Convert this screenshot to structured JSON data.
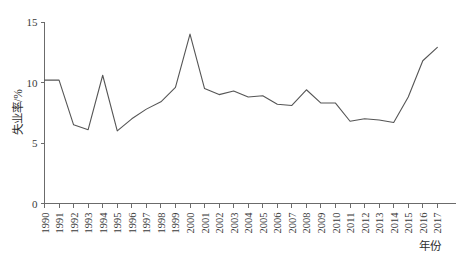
{
  "chart_data": {
    "type": "line",
    "title": "",
    "xlabel": "年份",
    "ylabel": "失业率/%",
    "xlim": [
      1990,
      2017
    ],
    "ylim": [
      0,
      15
    ],
    "yticks": [
      0,
      5,
      10,
      15
    ],
    "ytick_labels": [
      "0",
      "5",
      "10",
      "15"
    ],
    "grid": false,
    "legend": null,
    "line_color": "#555555",
    "x": [
      1990,
      1991,
      1992,
      1993,
      1994,
      1995,
      1996,
      1997,
      1998,
      1999,
      2000,
      2001,
      2002,
      2003,
      2004,
      2005,
      2006,
      2007,
      2008,
      2009,
      2010,
      2011,
      2012,
      2013,
      2014,
      2015,
      2016,
      2017
    ],
    "categories": [
      "1990",
      "1991",
      "1992",
      "1993",
      "1994",
      "1995",
      "1996",
      "1997",
      "1998",
      "1999",
      "2000",
      "2001",
      "2002",
      "2003",
      "2004",
      "2005",
      "2006",
      "2007",
      "2008",
      "2009",
      "2010",
      "2011",
      "2012",
      "2013",
      "2014",
      "2015",
      "2016",
      "2017"
    ],
    "values": [
      10.2,
      10.2,
      6.5,
      6.1,
      10.6,
      6.0,
      7.0,
      7.8,
      8.4,
      9.6,
      14.0,
      9.5,
      9.0,
      9.3,
      8.8,
      8.9,
      8.2,
      8.1,
      9.4,
      8.3,
      8.3,
      6.8,
      7.0,
      6.9,
      6.7,
      8.8,
      11.8,
      12.9
    ],
    "series": [
      {
        "name": "失业率",
        "values": [
          10.2,
          10.2,
          6.5,
          6.1,
          10.6,
          6.0,
          7.0,
          7.8,
          8.4,
          9.6,
          14.0,
          9.5,
          9.0,
          9.3,
          8.8,
          8.9,
          8.2,
          8.1,
          9.4,
          8.3,
          8.3,
          6.8,
          7.0,
          6.9,
          6.7,
          8.8,
          11.8,
          12.9
        ]
      }
    ]
  },
  "axes": {
    "y_title": "失业率/%",
    "x_title": "年份"
  }
}
